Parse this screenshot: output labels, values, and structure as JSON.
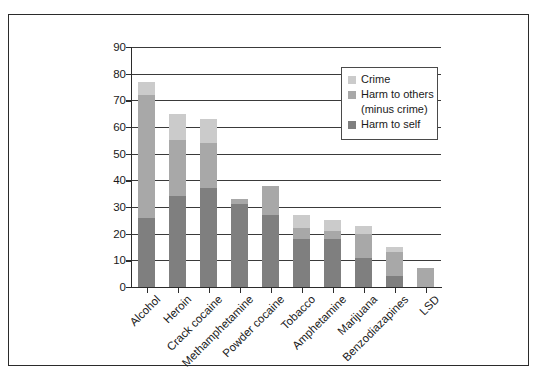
{
  "chart_data": {
    "type": "bar",
    "stacked": true,
    "title": "",
    "xlabel": "",
    "ylabel": "",
    "ylim": [
      0,
      90
    ],
    "ytick_labels": [
      "0",
      "10",
      "20",
      "30",
      "40",
      "50",
      "60",
      "70",
      "80",
      "90"
    ],
    "yticks": [
      0,
      10,
      20,
      30,
      40,
      50,
      60,
      70,
      80,
      90
    ],
    "grid": true,
    "legend_position": "upper right",
    "categories": [
      "Alcohol",
      "Heroin",
      "Crack cocaine",
      "Methamphetamine",
      "Powder cocaine",
      "Tobacco",
      "Amphetamine",
      "Marijuana",
      "Benzodiazapines",
      "LSD"
    ],
    "series": [
      {
        "name": "Harm to self",
        "color": "#7f7f7f",
        "values": [
          26,
          34,
          37,
          31,
          27,
          18,
          18,
          11,
          4,
          0
        ]
      },
      {
        "name": "Harm to others (minus crime)",
        "color": "#a8a8a8",
        "values": [
          46,
          21,
          17,
          2,
          11,
          4,
          3,
          9,
          9,
          7
        ]
      },
      {
        "name": "Crime",
        "color": "#cbcbcb",
        "values": [
          5,
          10,
          9,
          0,
          0,
          5,
          4,
          3,
          2,
          0
        ]
      }
    ],
    "totals": [
      77,
      65,
      63,
      33,
      38,
      27,
      25,
      23,
      15,
      7
    ]
  },
  "legend": {
    "entries": [
      {
        "label": "Crime",
        "color": "#cbcbcb"
      },
      {
        "label": "Harm to others",
        "sublabel": "(minus crime)",
        "color": "#a8a8a8"
      },
      {
        "label": "Harm to self",
        "color": "#7f7f7f"
      }
    ]
  },
  "colors": {
    "crime": "#cbcbcb",
    "harm_to_others": "#a8a8a8",
    "harm_to_self": "#7f7f7f",
    "axis": "#2b2b2b",
    "grid": "#3a3a3a",
    "frame": "#2b2b2b",
    "background": "#ffffff"
  }
}
